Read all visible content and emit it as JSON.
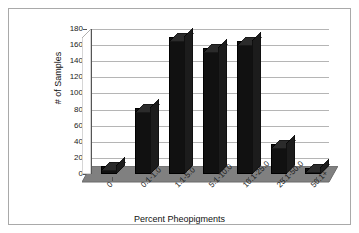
{
  "chart_data": {
    "type": "bar",
    "title": "",
    "xlabel": "Percent Pheopigments",
    "ylabel": "# of Samples",
    "categories": [
      "0",
      "0.1-1.0",
      "1.1-5.0",
      "5.1-10.0",
      "10.1-25.0",
      "25.1-50.0",
      "50.1+"
    ],
    "values": [
      10,
      82,
      170,
      157,
      165,
      37,
      8
    ],
    "ylim": [
      0,
      180
    ],
    "ytick_labels": [
      "0",
      "20",
      "40",
      "60",
      "80",
      "100",
      "120",
      "140",
      "160",
      "180"
    ],
    "ytick_values": [
      0,
      20,
      40,
      60,
      80,
      100,
      120,
      140,
      160,
      180
    ],
    "grid": true,
    "legend": false,
    "style": "3d-column",
    "bar_color": "#111111",
    "floor_color": "#808080",
    "gridline_color": "#b5b5b5",
    "wall_color": "#ffffff",
    "border_color": "#a9a9a9"
  }
}
